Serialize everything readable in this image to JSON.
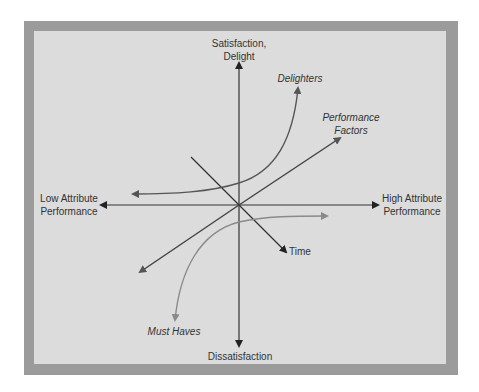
{
  "diagram": {
    "type": "kano-model",
    "axes": {
      "y_top": "Satisfaction,\nDelight",
      "y_top_line1": "Satisfaction,",
      "y_top_line2": "Delight",
      "y_bottom": "Dissatisfaction",
      "x_left_line1": "Low Attribute",
      "x_left_line2": "Performance",
      "x_right_line1": "High Attribute",
      "x_right_line2": "Performance",
      "diagonal": "Time"
    },
    "curves": [
      {
        "name": "Delighters",
        "label": "Delighters",
        "style": "curve, exponential up-right",
        "color": "#555555"
      },
      {
        "name": "Performance Factors",
        "label_line1": "Performance",
        "label_line2": "Factors",
        "style": "straight line through origin",
        "color": "#444444"
      },
      {
        "name": "Must Haves",
        "label": "Must Haves",
        "style": "curve, saturating",
        "color": "#8a8a8a"
      }
    ],
    "colors": {
      "frame": "#9b9b9b",
      "panel": "#dcdcdc",
      "axis": "#222222",
      "text": "#333333"
    }
  }
}
